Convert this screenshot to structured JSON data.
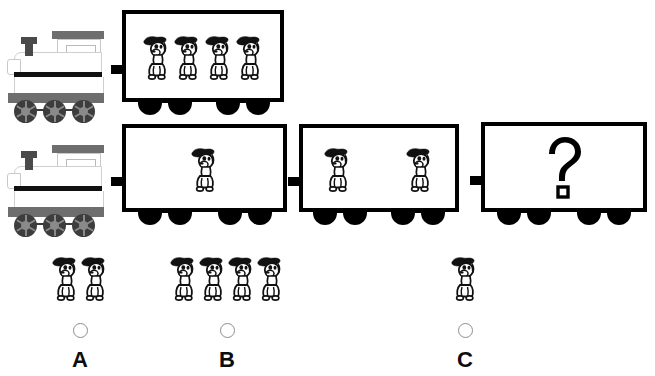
{
  "puzzle": {
    "type": "train-pattern-counting",
    "icon_name": "dog-figure",
    "question_symbol": "?"
  },
  "rows": [
    {
      "name": "example-train",
      "locomotive": {
        "icon": "steam-locomotive",
        "wheels": 3
      },
      "cars": [
        {
          "name": "car-row1-1",
          "dogs": 4,
          "content": "dogs"
        }
      ]
    },
    {
      "name": "question-train",
      "locomotive": {
        "icon": "steam-locomotive",
        "wheels": 3
      },
      "cars": [
        {
          "name": "car-row2-1",
          "dogs": 1,
          "content": "dogs"
        },
        {
          "name": "car-row2-2",
          "dogs": 2,
          "content": "dogs"
        },
        {
          "name": "car-row2-3",
          "dogs": 0,
          "content": "question",
          "symbol": "?"
        }
      ]
    }
  ],
  "options": [
    {
      "letter": "A",
      "dogs": 2,
      "selected": false
    },
    {
      "letter": "B",
      "dogs": 4,
      "selected": false
    },
    {
      "letter": "C",
      "dogs": 1,
      "selected": false
    }
  ],
  "colors": {
    "outline": "#000000",
    "loco_roof": "#6e6e6e",
    "loco_frame": "#6e6e6e",
    "loco_wheel": "#3d3d3d",
    "loco_hub": "#8a8a8a",
    "background": "#ffffff",
    "radio_border": "#8d8d8d"
  }
}
